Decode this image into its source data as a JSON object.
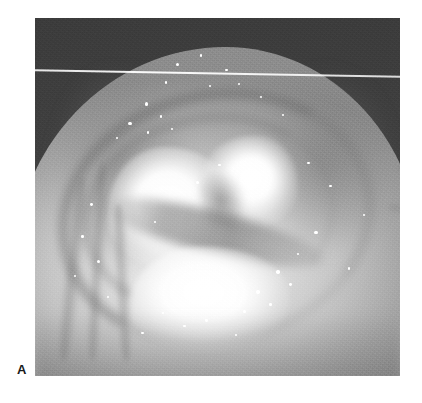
{
  "figure": {
    "kind": "clinical-photograph",
    "modality": "colposcopy / endoscopic still",
    "color_mode": "grayscale",
    "panel_label": "A",
    "frame": {
      "left": 35,
      "top": 18,
      "width": 365,
      "height": 358,
      "page_background": "#ffffff"
    },
    "palette": {
      "page_background": "#ffffff",
      "photo_background_dark": "#3d3d3d",
      "tissue_midtone": "#c9c4bd",
      "tissue_highlight": "#f3f1ee",
      "tissue_shadow": "#8f8981",
      "specular_white": "#ffffff",
      "label_color": "#1a1a1a"
    },
    "features": [
      {
        "name": "dark-background-field",
        "description": "Dark, grainy out-of-focus background occupying the upper-left and upper-right corners of the frame."
      },
      {
        "name": "tissue-dome",
        "description": "Large rounded pale mucosal mass filling the centre and lower portion of the frame."
      },
      {
        "name": "central-white-lesion",
        "description": "Bright, sharply demarcated white plaque in the mid-left of the tissue surface."
      },
      {
        "name": "right-white-lesion",
        "description": "Second bright white patch immediately to the right of the central plaque."
      },
      {
        "name": "lower-white-plaque",
        "description": "Broad bright region across the lower-central tissue surface."
      },
      {
        "name": "dark-oblique-band",
        "description": "Darker oblique groove running down-right, separating the upper and lower bright zones."
      },
      {
        "name": "circumferential-rim-arc",
        "description": "Curved darker rim arcing around the bright lesion, suggesting a crater or orifice margin."
      },
      {
        "name": "left-fold-ridges",
        "description": "Vertical mucosal folds along the left flank of the specimen."
      },
      {
        "name": "right-fold-ridges",
        "description": "Concentric curved mucosal folds along the right flank."
      },
      {
        "name": "specular-highlights",
        "description": "Scattered pinpoint white light reflections across the wet tissue surface."
      },
      {
        "name": "scan-line-artifact",
        "description": "Thin bright horizontal line crossing the entire frame near the top, tilting slightly downward to the right — a scanning/print artifact."
      }
    ],
    "specular_highlights": [
      {
        "x": 39.0,
        "y": 13.0,
        "r": 1.5
      },
      {
        "x": 45.5,
        "y": 10.5,
        "r": 1.2
      },
      {
        "x": 52.5,
        "y": 14.5,
        "r": 1.4
      },
      {
        "x": 36.0,
        "y": 18.0,
        "r": 1.1
      },
      {
        "x": 48.0,
        "y": 19.0,
        "r": 1.3
      },
      {
        "x": 56.0,
        "y": 18.5,
        "r": 1.0
      },
      {
        "x": 30.5,
        "y": 24.0,
        "r": 1.6
      },
      {
        "x": 34.5,
        "y": 27.5,
        "r": 1.2
      },
      {
        "x": 26.0,
        "y": 29.5,
        "r": 1.8
      },
      {
        "x": 31.0,
        "y": 32.0,
        "r": 1.3
      },
      {
        "x": 22.5,
        "y": 33.5,
        "r": 1.1
      },
      {
        "x": 37.5,
        "y": 31.0,
        "r": 1.0
      },
      {
        "x": 62.0,
        "y": 22.0,
        "r": 1.1
      },
      {
        "x": 68.0,
        "y": 27.0,
        "r": 1.0
      },
      {
        "x": 75.0,
        "y": 40.5,
        "r": 1.3
      },
      {
        "x": 81.0,
        "y": 47.0,
        "r": 1.2
      },
      {
        "x": 15.5,
        "y": 52.0,
        "r": 1.4
      },
      {
        "x": 13.0,
        "y": 61.0,
        "r": 1.2
      },
      {
        "x": 17.5,
        "y": 68.0,
        "r": 1.5
      },
      {
        "x": 11.0,
        "y": 72.0,
        "r": 1.1
      },
      {
        "x": 20.0,
        "y": 78.0,
        "r": 1.0
      },
      {
        "x": 77.0,
        "y": 60.0,
        "r": 1.6
      },
      {
        "x": 72.0,
        "y": 66.0,
        "r": 1.2
      },
      {
        "x": 66.5,
        "y": 71.0,
        "r": 1.8
      },
      {
        "x": 70.0,
        "y": 74.5,
        "r": 1.4
      },
      {
        "x": 61.0,
        "y": 76.5,
        "r": 2.0
      },
      {
        "x": 64.5,
        "y": 80.0,
        "r": 1.3
      },
      {
        "x": 57.5,
        "y": 82.0,
        "r": 1.5
      },
      {
        "x": 52.0,
        "y": 79.0,
        "r": 1.1
      },
      {
        "x": 47.0,
        "y": 84.5,
        "r": 1.4
      },
      {
        "x": 41.0,
        "y": 86.0,
        "r": 1.2
      },
      {
        "x": 35.0,
        "y": 82.5,
        "r": 1.0
      },
      {
        "x": 29.5,
        "y": 88.0,
        "r": 1.3
      },
      {
        "x": 55.0,
        "y": 88.5,
        "r": 1.1
      },
      {
        "x": 44.5,
        "y": 46.0,
        "r": 1.6
      },
      {
        "x": 50.5,
        "y": 41.0,
        "r": 1.2
      },
      {
        "x": 33.0,
        "y": 57.0,
        "r": 1.0
      },
      {
        "x": 86.0,
        "y": 70.0,
        "r": 1.1
      },
      {
        "x": 90.0,
        "y": 55.0,
        "r": 1.0
      }
    ]
  }
}
